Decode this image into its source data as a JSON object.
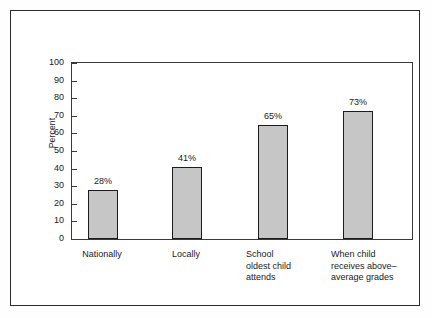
{
  "chart_data": {
    "type": "bar",
    "title": "",
    "subtitle": "",
    "xlabel": "",
    "ylabel": "Percent",
    "ylim": [
      0,
      100
    ],
    "yticks": [
      "0",
      "10",
      "20",
      "30",
      "40",
      "50",
      "60",
      "70",
      "80",
      "90",
      "100"
    ],
    "grid": false,
    "legend": "none",
    "categories": [
      "Nationally",
      "Locally",
      "School\noldest child\nattends",
      "When child\nreceives above–\naverage grades"
    ],
    "values": [
      28,
      41,
      65,
      73
    ],
    "value_labels": [
      "28%",
      "41%",
      "65%",
      "73%"
    ],
    "colors": {
      "bar_fill": "#c6c6c6",
      "bar_edge": "#1c1c1c",
      "axis": "#3a3a3a",
      "frame": "#2b2b2b",
      "text": "#1a1a1a",
      "background": "#ffffff"
    }
  },
  "axis": {
    "y_title": "Percent",
    "ticks": [
      {
        "label": "100",
        "value": 100
      },
      {
        "label": "90",
        "value": 90
      },
      {
        "label": "80",
        "value": 80
      },
      {
        "label": "70",
        "value": 70
      },
      {
        "label": "60",
        "value": 60
      },
      {
        "label": "50",
        "value": 50
      },
      {
        "label": "40",
        "value": 40
      },
      {
        "label": "30",
        "value": 30
      },
      {
        "label": "20",
        "value": 20
      },
      {
        "label": "10",
        "value": 10
      },
      {
        "label": "0",
        "value": 0
      }
    ]
  },
  "bars": [
    {
      "label": "Nationally",
      "value_label": "28%",
      "value": 28,
      "align": "center"
    },
    {
      "label": "Locally",
      "value_label": "41%",
      "value": 41,
      "align": "center"
    },
    {
      "label": "School\noldest child\nattends",
      "value_label": "65%",
      "value": 65,
      "align": "left"
    },
    {
      "label": "When child\nreceives above–\naverage grades",
      "value_label": "73%",
      "value": 73,
      "align": "left"
    }
  ]
}
